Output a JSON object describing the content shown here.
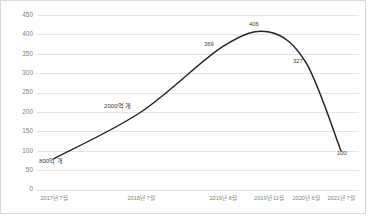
{
  "chart_data": {
    "type": "line",
    "title": "",
    "xlabel": "",
    "ylabel": "",
    "ylim": [
      0,
      450
    ],
    "grid": true,
    "legend": "none",
    "smooth": true,
    "line_color": "#262626",
    "categories": [
      "2017년 7월",
      "2018년 7월",
      "2019년 8월",
      "2019년 11월",
      "2020년 6월",
      "2021년 7월"
    ],
    "yticks": [
      "0",
      "50",
      "100",
      "150",
      "200",
      "250",
      "300",
      "350",
      "400",
      "450"
    ],
    "ytick_values": [
      0,
      50,
      100,
      150,
      200,
      250,
      300,
      350,
      400,
      450
    ],
    "points": [
      {
        "x_label": "2017년 7월",
        "value": 80,
        "data_label": "800억 개"
      },
      {
        "x_label": "2018년 7월",
        "value": 200,
        "data_label": "2000억 개"
      },
      {
        "x_label": "2019년 8월",
        "value": 369,
        "data_label": "369"
      },
      {
        "x_label": "2019년 11월",
        "value": 406,
        "data_label": "406"
      },
      {
        "x_label": "2020년 6월",
        "value": 327,
        "data_label": "327"
      },
      {
        "x_label": "2021년 7월",
        "value": 100,
        "data_label": "100"
      }
    ],
    "values": [
      80,
      200,
      369,
      406,
      327,
      100
    ],
    "data_labels": [
      "800억 개",
      "2000억 개",
      "369",
      "406",
      "327",
      "100"
    ]
  },
  "axes": {
    "y": {
      "ticks": [
        {
          "label": "450",
          "top": 14
        },
        {
          "label": "400",
          "top": 33.4
        },
        {
          "label": "350",
          "top": 52.8
        },
        {
          "label": "300",
          "top": 72.2
        },
        {
          "label": "250",
          "top": 91.6
        },
        {
          "label": "200",
          "top": 111
        },
        {
          "label": "150",
          "top": 130.4
        },
        {
          "label": "100",
          "top": 149.8
        },
        {
          "label": "50",
          "top": 169.2
        },
        {
          "label": "0",
          "top": 188.6
        }
      ]
    },
    "x": {
      "ticks": [
        {
          "label": "2017년 7월",
          "left": 53
        },
        {
          "label": "2018년 7월",
          "left": 140
        },
        {
          "label": "2019년 8월",
          "left": 222
        },
        {
          "label": "2019년 11월",
          "left": 268
        },
        {
          "label": "2020년 6월",
          "left": 305
        },
        {
          "label": "2021년 7월",
          "left": 340
        }
      ]
    }
  },
  "annotations": [
    {
      "text": "800억 개",
      "left": 38,
      "top": 157
    },
    {
      "text": "2000억 개",
      "left": 103,
      "top": 102
    },
    {
      "text": "369",
      "left": 203,
      "top": 41
    },
    {
      "text": "406",
      "left": 248,
      "top": 21
    },
    {
      "text": "327",
      "left": 292,
      "top": 58
    },
    {
      "text": "100",
      "left": 336,
      "top": 150
    }
  ]
}
